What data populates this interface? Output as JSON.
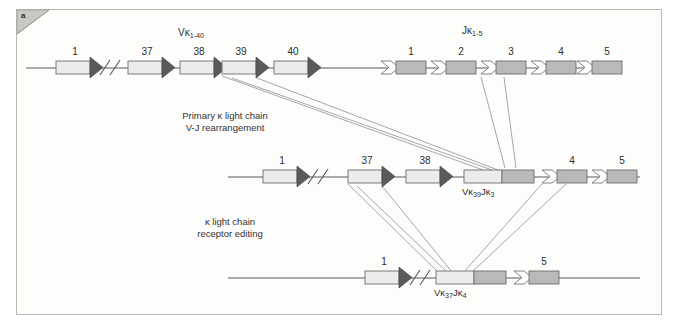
{
  "figure": {
    "panel_letter": "a",
    "background": "#ffffff",
    "panel_border": "#b9b9b4"
  },
  "colors": {
    "v_segment_fill": "#ececec",
    "v_segment_stroke": "#6e6e6e",
    "v_arrow_fill": "#5a5a5a",
    "j_segment_fill": "#b9b9b9",
    "j_segment_stroke": "#6e6e6e",
    "j_arrow_fill": "#ffffff",
    "line": "#5a5a5a",
    "connector": "#9a9a9a",
    "text": "#2e2e2e"
  },
  "group_labels": {
    "v_region": {
      "base": "Vκ",
      "sub": "1-40",
      "full": "Vκ1-40"
    },
    "j_region": {
      "base": "Jκ",
      "sub": "1-5",
      "full": "Jκ1-5"
    }
  },
  "annotations": [
    {
      "id": "primary-rearrangement",
      "line1": "Primary κ light chain",
      "line2": "V-J rearrangement"
    },
    {
      "id": "receptor-editing",
      "line1": "κ light chain",
      "line2": "receptor editing"
    }
  ],
  "rows": [
    {
      "id": "germline",
      "name": "germline-locus",
      "v_segments": [
        {
          "label": "1"
        },
        {
          "label": "37"
        },
        {
          "label": "38"
        },
        {
          "label": "39"
        },
        {
          "label": "40"
        }
      ],
      "gap_break": true,
      "j_segments": [
        {
          "label": "1"
        },
        {
          "label": "2"
        },
        {
          "label": "3"
        },
        {
          "label": "4"
        },
        {
          "label": "5"
        }
      ],
      "fusion": null
    },
    {
      "id": "first-rearrangement",
      "name": "primary-rearranged-locus",
      "v_segments": [
        {
          "label": "1"
        },
        {
          "label": "37"
        },
        {
          "label": "38"
        }
      ],
      "gap_break": true,
      "j_segments": [
        {
          "label": "4"
        },
        {
          "label": "5"
        }
      ],
      "fusion": {
        "base1": "Vκ",
        "sub1": "39",
        "base2": "Jκ",
        "sub2": "3",
        "full": "Vκ39Jκ3"
      }
    },
    {
      "id": "edited-rearrangement",
      "name": "edited-locus",
      "v_segments": [
        {
          "label": "1"
        }
      ],
      "gap_break": true,
      "j_segments": [
        {
          "label": "5"
        }
      ],
      "fusion": {
        "base1": "Vκ",
        "sub1": "37",
        "base2": "Jκ",
        "sub2": "4",
        "full": "Vκ37Jκ4"
      }
    }
  ]
}
